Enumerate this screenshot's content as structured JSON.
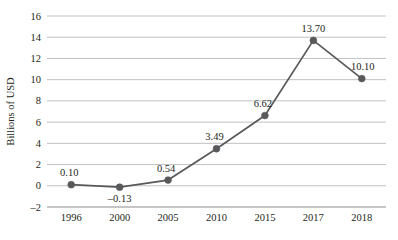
{
  "chart_data": {
    "type": "line",
    "title": "",
    "subtitle": "",
    "xlabel": "",
    "ylabel": "Billions of USD",
    "categories": [
      "1996",
      "2000",
      "2005",
      "2010",
      "2015",
      "2017",
      "2018"
    ],
    "values": [
      0.1,
      -0.13,
      0.54,
      3.49,
      6.62,
      13.7,
      10.1
    ],
    "point_labels": [
      "0.10",
      "–0.13",
      "0.54",
      "3.49",
      "6.62",
      "13.70",
      "10.10"
    ],
    "label_positions": [
      "above",
      "below",
      "above",
      "above",
      "above",
      "above",
      "above"
    ],
    "ylim": [
      -2,
      16
    ],
    "y_ticks": [
      16,
      14,
      12,
      10,
      8,
      6,
      4,
      2,
      0,
      -2
    ],
    "y_tick_labels": [
      "16",
      "14",
      "12",
      "10",
      "8",
      "6",
      "4",
      "2",
      "0",
      "–2"
    ],
    "grid": true,
    "grid_axis": "y",
    "legend": false,
    "legend_position": "none",
    "marker": "circle",
    "colors": {
      "line": "#58595b",
      "marker": "#58595b",
      "grid": "#b9babc",
      "axis": "#8d8e90",
      "text": "#231f20",
      "background": "#ffffff"
    }
  }
}
